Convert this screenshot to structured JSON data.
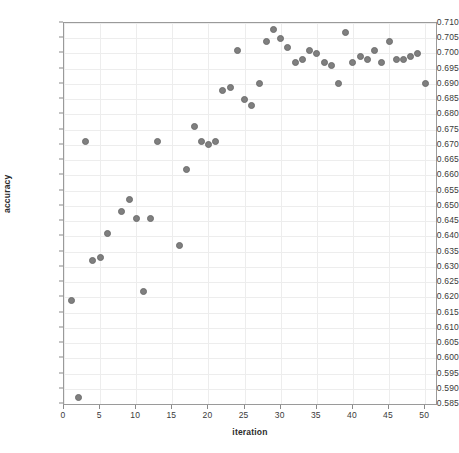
{
  "chart_data": {
    "type": "scatter",
    "title": "",
    "xlabel": "iteration",
    "ylabel": "accuracy",
    "xlim": [
      0,
      51.5
    ],
    "ylim": [
      0.585,
      0.71
    ],
    "grid": true,
    "legend": null,
    "xticks": [
      0,
      5,
      10,
      15,
      20,
      25,
      30,
      35,
      40,
      45,
      50
    ],
    "xtick_labels": [
      "0",
      "5",
      "10",
      "15",
      "20",
      "25",
      "30",
      "35",
      "40",
      "45",
      "50"
    ],
    "yticks": [
      0.585,
      0.59,
      0.595,
      0.6,
      0.605,
      0.61,
      0.615,
      0.62,
      0.625,
      0.63,
      0.635,
      0.64,
      0.645,
      0.65,
      0.655,
      0.66,
      0.665,
      0.67,
      0.675,
      0.68,
      0.685,
      0.69,
      0.695,
      0.7,
      0.705,
      0.71
    ],
    "ytick_labels": [
      "0.585",
      "0.590",
      "0.595",
      "0.600",
      "0.605",
      "0.610",
      "0.615",
      "0.620",
      "0.625",
      "0.630",
      "0.635",
      "0.640",
      "0.645",
      "0.650",
      "0.655",
      "0.660",
      "0.665",
      "0.670",
      "0.675",
      "0.680",
      "0.685",
      "0.690",
      "0.695",
      "0.700",
      "0.705",
      "0.710"
    ],
    "marker": {
      "shape": "circle",
      "color": "#7f7f7f",
      "edge_color": "#6e6e6e",
      "size_px": 7
    },
    "series": [
      {
        "name": "accuracy",
        "x": [
          1,
          2,
          3,
          4,
          5,
          6,
          7,
          8,
          9,
          10,
          11,
          12,
          13,
          14,
          15,
          16,
          17,
          18,
          19,
          20,
          21,
          22,
          23,
          24,
          25,
          26,
          27,
          28,
          29,
          30,
          31,
          32,
          33,
          34,
          35,
          36,
          37,
          38,
          39,
          40,
          41,
          42,
          43,
          44,
          45,
          46,
          47,
          48,
          49,
          50
        ],
        "y": [
          0.619,
          0.587,
          0.671,
          0.632,
          0.633,
          0.641,
          0.886,
          0.648,
          0.652,
          0.646,
          0.622,
          0.646,
          0.671,
          0.884,
          0.884,
          0.637,
          0.662,
          0.676,
          0.671,
          0.67,
          0.671,
          0.688,
          0.689,
          0.701,
          0.685,
          0.683,
          0.69,
          0.704,
          0.708,
          0.705,
          0.702,
          0.697,
          0.698,
          0.701,
          0.7,
          0.697,
          0.696,
          0.69,
          0.707,
          0.697,
          0.699,
          0.698,
          0.701,
          0.697,
          0.704,
          0.698,
          0.698,
          0.699,
          0.7,
          0.69
        ]
      }
    ]
  },
  "axes": {
    "xlabel": "iteration",
    "ylabel": "accuracy"
  }
}
